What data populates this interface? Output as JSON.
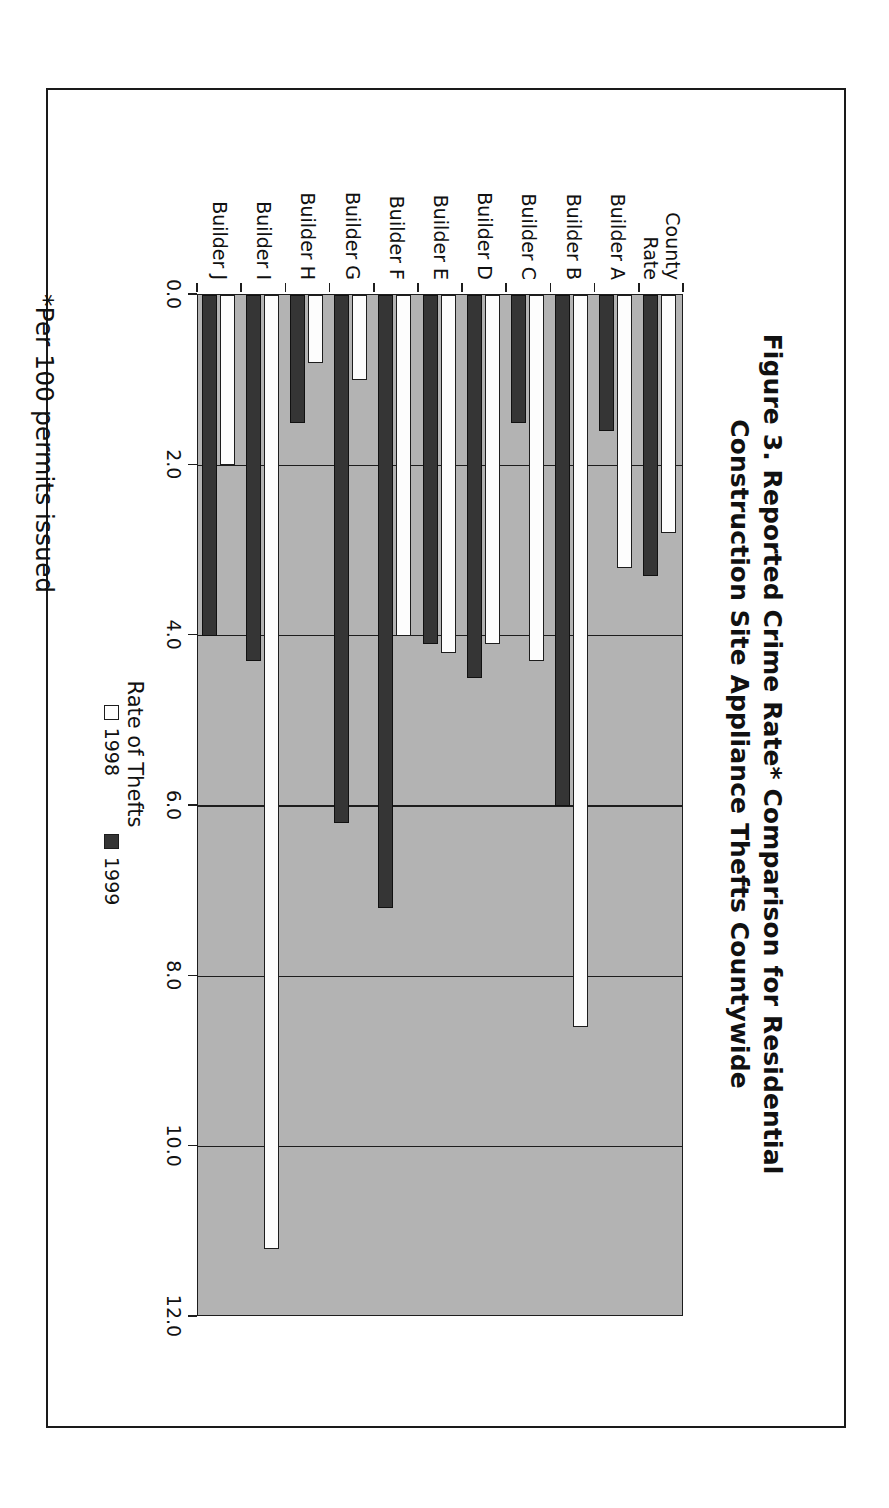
{
  "figure": {
    "title_line1": "Figure 3. Reported Crime Rate* Comparison for Residential",
    "title_line2": "Construction Site Appliance Thefts Countywide",
    "footnote": "*Per 100 permits issued"
  },
  "chart_data": {
    "type": "bar",
    "orientation": "horizontal",
    "title": "Figure 3. Reported Crime Rate* Comparison for Residential Construction Site Appliance Thefts Countywide",
    "xlabel": "",
    "ylabel": "Rate of Thefts",
    "value_axis_label": "Rate of Thefts",
    "categories": [
      "County Rate",
      "Builder A",
      "Builder B",
      "Builder C",
      "Builder D",
      "Builder E",
      "Builder F",
      "Builder G",
      "Builder H",
      "Builder I",
      "Builder J"
    ],
    "category_labels_multiline": [
      [
        "County",
        "Rate"
      ],
      [
        "Builder A"
      ],
      [
        "Builder B"
      ],
      [
        "Builder C"
      ],
      [
        "Builder D"
      ],
      [
        "Builder E"
      ],
      [
        "Builder F"
      ],
      [
        "Builder G"
      ],
      [
        "Builder H"
      ],
      [
        "Builder I"
      ],
      [
        "Builder J"
      ]
    ],
    "series": [
      {
        "name": "1998",
        "color": "#ffffff",
        "values": [
          2.8,
          3.2,
          8.6,
          4.3,
          4.1,
          4.2,
          4.0,
          1.0,
          0.8,
          11.2,
          2.0
        ]
      },
      {
        "name": "1999",
        "color": "#353535",
        "values": [
          3.3,
          1.6,
          6.0,
          1.5,
          4.5,
          4.1,
          7.2,
          6.2,
          1.5,
          4.3,
          4.0
        ]
      }
    ],
    "ylim": [
      0.0,
      12.0
    ],
    "value_ticks": [
      "0.0",
      "2.0",
      "4.0",
      "6.0",
      "8.0",
      "10.0",
      "12.0"
    ],
    "value_tick_values": [
      0.0,
      2.0,
      4.0,
      6.0,
      8.0,
      10.0,
      12.0
    ],
    "grid": true,
    "grid_axis": "value",
    "legend_position": "bottom",
    "legend": [
      "1998",
      "1999"
    ],
    "plot_background": "#b3b3b3",
    "axis_color": "#1d1d1d"
  }
}
